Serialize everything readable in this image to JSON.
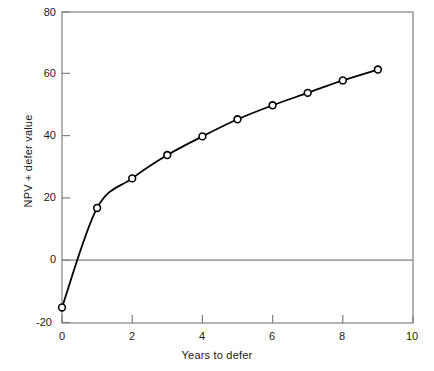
{
  "chart_data": {
    "type": "line",
    "title": "",
    "xlabel": "Years to defer",
    "ylabel": "NPV + defer value",
    "xlim": [
      0,
      10
    ],
    "ylim": [
      -20,
      80
    ],
    "xticks": [
      "0",
      "2",
      "4",
      "6",
      "8",
      "10"
    ],
    "xtick_values": [
      0,
      2,
      4,
      6,
      8,
      10
    ],
    "yticks": [
      "80",
      "60",
      "40",
      "20",
      "0",
      "-20"
    ],
    "ytick_values": [
      80,
      60,
      40,
      20,
      0,
      -20
    ],
    "grid": false,
    "legend": null,
    "zero_line": true,
    "marker": "open-circle",
    "line_color": "#000000",
    "axis_color": "#808080",
    "x": [
      0,
      1,
      2,
      3,
      4,
      5,
      6,
      7,
      8,
      9
    ],
    "values": [
      -15,
      17,
      26.5,
      34,
      40,
      45.5,
      50,
      54,
      58,
      61.5
    ],
    "series": [
      {
        "name": "NPV + defer value",
        "x": [
          0,
          1,
          2,
          3,
          4,
          5,
          6,
          7,
          8,
          9
        ],
        "values": [
          -15,
          17,
          26.5,
          34,
          40,
          45.5,
          50,
          54,
          58,
          61.5
        ]
      }
    ]
  },
  "axes": {
    "x_title": "Years to defer",
    "y_title": "NPV + defer value"
  }
}
